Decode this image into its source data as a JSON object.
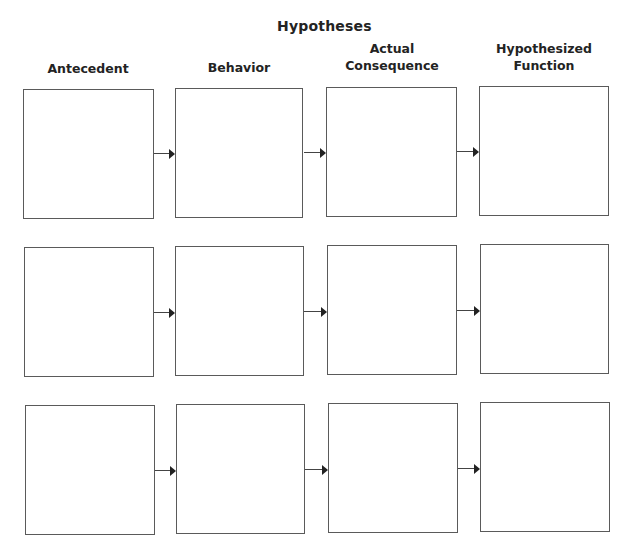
{
  "title": "Hypotheses",
  "columns": [
    {
      "label_line1": "Antecedent",
      "label_line2": ""
    },
    {
      "label_line1": "Behavior",
      "label_line2": ""
    },
    {
      "label_line1": "Actual",
      "label_line2": "Consequence"
    },
    {
      "label_line1": "Hypothesized",
      "label_line2": "Function"
    }
  ],
  "rows": 3,
  "colors": {
    "border": "#5a5a5a",
    "arrow": "#222222",
    "text": "#232323"
  }
}
